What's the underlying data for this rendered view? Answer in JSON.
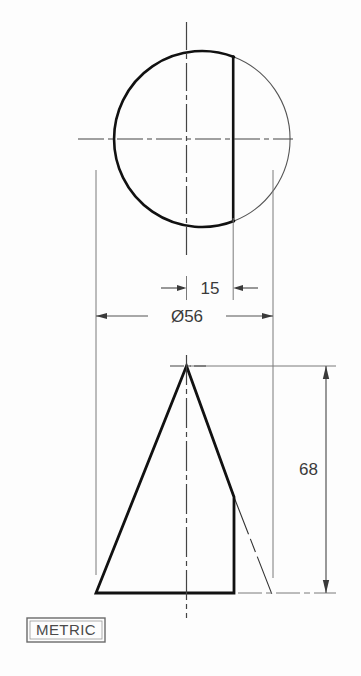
{
  "drawing": {
    "title": "Truncated cone engineering drawing",
    "units_note": "METRIC",
    "views": {
      "top": {
        "name": "top-view-circle",
        "shape": "circle-with-flat",
        "diameter_label": "Ø56"
      },
      "front": {
        "name": "front-view-cone",
        "shape": "triangle-truncated",
        "height_label": "68"
      }
    },
    "dimensions": [
      {
        "id": "flat-offset",
        "label": "15",
        "orientation": "horizontal",
        "arrows": "outside"
      },
      {
        "id": "diameter",
        "label": "Ø56",
        "orientation": "horizontal",
        "arrows": "inside"
      },
      {
        "id": "height",
        "label": "68",
        "orientation": "vertical",
        "arrows": "inside"
      }
    ],
    "colors": {
      "object_line": "#111111",
      "thin_line": "#555555",
      "dimension_line": "#555555",
      "center_line": "#444444",
      "text": "#3a3a3a",
      "background": "#fdfdfd"
    }
  }
}
